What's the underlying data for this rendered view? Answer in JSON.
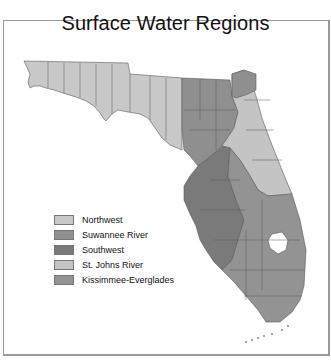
{
  "title": "Surface Water Regions",
  "legend": {
    "items": [
      {
        "label": "Northwest",
        "color": "#c8c8c8"
      },
      {
        "label": "Suwannee River",
        "color": "#8f8f8f"
      },
      {
        "label": "Southwest",
        "color": "#7a7a7a"
      },
      {
        "label": "St. Johns River",
        "color": "#c4c4c4"
      },
      {
        "label": "Kissimmee-Everglades",
        "color": "#939393"
      }
    ]
  },
  "colors": {
    "northwest": "#c8c8c8",
    "suwannee": "#8f8f8f",
    "southwest": "#7a7a7a",
    "stjohns": "#c4c4c4",
    "kissimmee": "#939393",
    "county_lines": "#5a5a5a",
    "lake": "#ffffff"
  }
}
